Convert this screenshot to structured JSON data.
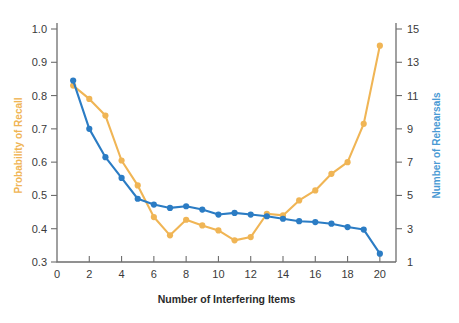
{
  "chart_data": {
    "type": "line",
    "title": "",
    "xlabel": "Number of Interfering Items",
    "x": [
      1,
      2,
      3,
      4,
      5,
      6,
      7,
      8,
      9,
      10,
      11,
      12,
      13,
      14,
      15,
      16,
      17,
      18,
      19,
      20
    ],
    "xlim": [
      0,
      21
    ],
    "xticks": [
      0,
      2,
      4,
      6,
      8,
      10,
      12,
      14,
      16,
      18,
      20
    ],
    "xticklabels": [
      "0",
      "2",
      "4",
      "6",
      "8",
      "10",
      "12",
      "14",
      "16",
      "18",
      "20"
    ],
    "grid": false,
    "legend": "none",
    "axes": [
      {
        "id": "left",
        "label": "Probability of Recall",
        "color": "#f0b555",
        "lim": [
          0.3,
          1.0
        ],
        "ticks": [
          0.3,
          0.4,
          0.5,
          0.6,
          0.7,
          0.8,
          0.9,
          1.0
        ],
        "ticklabels": [
          "0.3",
          "0.4",
          "0.5",
          "0.6",
          "0.7",
          "0.8",
          "0.9",
          "1.0"
        ]
      },
      {
        "id": "right",
        "label": "Number of Rehearsals",
        "color": "#4a9ad4",
        "lim": [
          1,
          15
        ],
        "ticks": [
          1,
          3,
          5,
          7,
          9,
          11,
          13,
          15
        ],
        "ticklabels": [
          "1",
          "3",
          "5",
          "7",
          "9",
          "11",
          "13",
          "15"
        ]
      }
    ],
    "series": [
      {
        "name": "Probability of Recall",
        "axis": "left",
        "color": "#f0b555",
        "marker": "circle",
        "values": [
          0.83,
          0.79,
          0.74,
          0.605,
          0.53,
          0.435,
          0.38,
          0.427,
          0.41,
          0.395,
          0.365,
          0.375,
          0.445,
          0.44,
          0.485,
          0.515,
          0.565,
          0.6,
          0.715,
          0.95
        ]
      },
      {
        "name": "Number of Rehearsals",
        "axis": "right",
        "color": "#2b7cc4",
        "marker": "circle",
        "values": [
          11.9,
          9.0,
          7.3,
          6.05,
          4.8,
          4.45,
          4.25,
          4.35,
          4.15,
          3.85,
          3.95,
          3.85,
          3.75,
          3.6,
          3.45,
          3.4,
          3.3,
          3.1,
          2.95,
          1.5
        ]
      }
    ]
  }
}
